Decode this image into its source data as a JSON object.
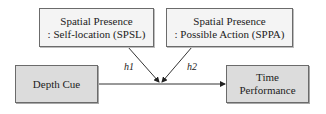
{
  "diagram": {
    "moderators": [
      {
        "id": "spsl",
        "line1": "Spatial Presence",
        "line2": ": Self-location (SPSL)"
      },
      {
        "id": "sppa",
        "line1": "Spatial Presence",
        "line2": ": Possible Action (SPPA)"
      }
    ],
    "independent": {
      "label": "Depth Cue"
    },
    "dependent": {
      "line1": "Time",
      "line2": "Performance"
    },
    "hypotheses": [
      {
        "label": "h1",
        "from": "spsl"
      },
      {
        "label": "h2",
        "from": "sppa"
      }
    ],
    "colors": {
      "node_fill": "#dcdcdc",
      "moderator_fill": "#f4f4f4",
      "stroke": "#6b6b6b"
    }
  }
}
